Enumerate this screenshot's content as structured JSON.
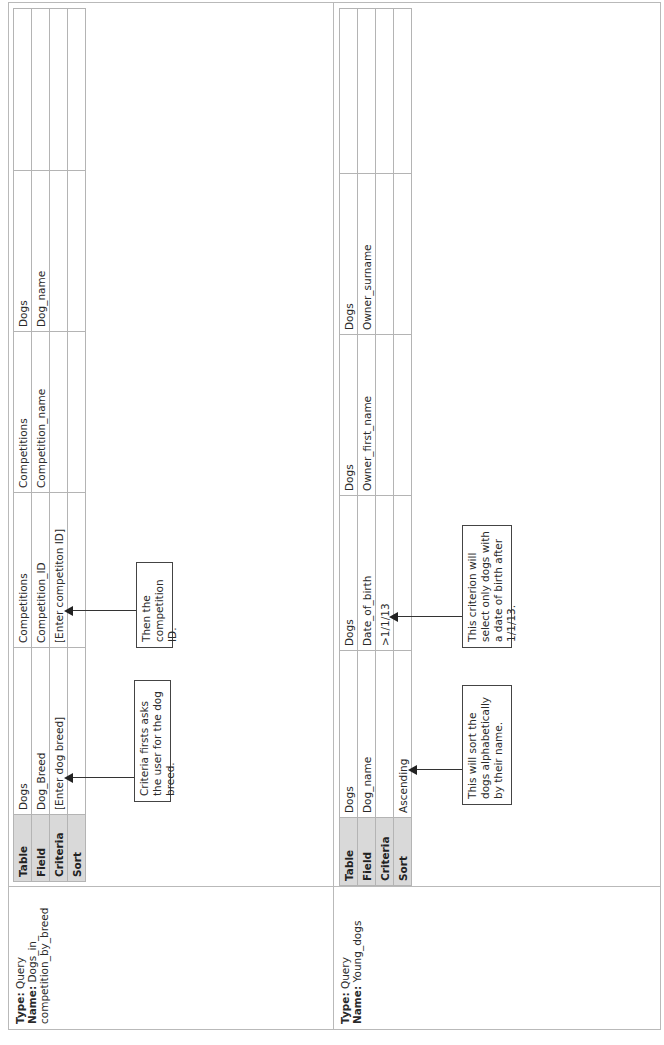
{
  "queries": [
    {
      "type_label": "Type:",
      "type_value": "Query",
      "name_label": "Name:",
      "name_value_line1": "Dogs_in_",
      "name_value_line2": "competition_by_breed",
      "grid": {
        "row_headers": [
          "Table",
          "Field",
          "Criteria",
          "Sort"
        ],
        "columns": [
          {
            "table": "Dogs",
            "field": "Dog_Breed",
            "criteria": "[Enter dog breed]",
            "sort": ""
          },
          {
            "table": "Competitions",
            "field": "Competition_ID",
            "criteria": "[Enter competiton ID]",
            "sort": ""
          },
          {
            "table": "Competitions",
            "field": "Competition_name",
            "criteria": "",
            "sort": ""
          },
          {
            "table": "Dogs",
            "field": "Dog_name",
            "criteria": "",
            "sort": ""
          },
          {
            "table": "",
            "field": "",
            "criteria": "",
            "sort": ""
          }
        ]
      },
      "callouts": [
        {
          "text": "Criteria firsts asks the user for the dog breed.",
          "target": "criteria column 1"
        },
        {
          "text": "Then the competition ID.",
          "target": "criteria column 2"
        }
      ]
    },
    {
      "type_label": "Type:",
      "type_value": "Query",
      "name_label": "Name:",
      "name_value_line1": "Young_dogs",
      "name_value_line2": "",
      "grid": {
        "row_headers": [
          "Table",
          "Field",
          "Criteria",
          "Sort"
        ],
        "columns": [
          {
            "table": "Dogs",
            "field": "Dog_name",
            "criteria": "",
            "sort": "Ascending"
          },
          {
            "table": "Dogs",
            "field": "Date_of_birth",
            "criteria": ">1/1/13",
            "sort": ""
          },
          {
            "table": "Dogs",
            "field": "Owner_first_name",
            "criteria": "",
            "sort": ""
          },
          {
            "table": "Dogs",
            "field": "Owner_surname",
            "criteria": "",
            "sort": ""
          },
          {
            "table": "",
            "field": "",
            "criteria": "",
            "sort": ""
          }
        ]
      },
      "callouts": [
        {
          "text": "This will sort the dogs alphabetically by their name.",
          "target": "sort column 1"
        },
        {
          "text": "This criterion will select only dogs with a date of birth after 1/1/13.",
          "target": "criteria column 2"
        }
      ]
    }
  ]
}
